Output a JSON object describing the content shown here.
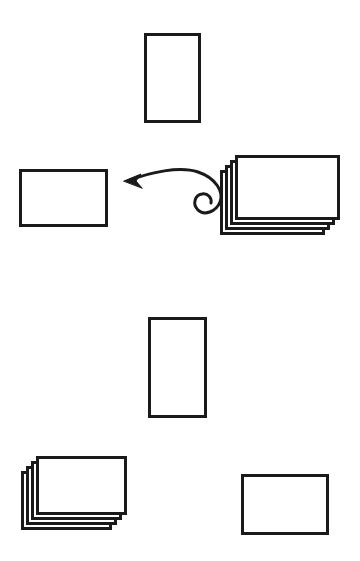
{
  "canvas": {
    "width": 360,
    "height": 561,
    "background_color": "#ffffff",
    "stroke_color": "#1a1a1a",
    "card_fill_color": "#ffffff",
    "description": "Hand-drawn style diagram of blank rectangular cards: single cards and stacks of four cards, with a curly spiral-tailed arrow pointing from the right-hand stack toward the left-hand single card."
  },
  "arrow": {
    "label": "curly-arrow-left",
    "stroke_color": "#1a1a1a",
    "stroke_width": 3,
    "direction": "left",
    "tail_style": "spiral",
    "tip": {
      "x": 124,
      "y": 181
    },
    "spiral_center": {
      "x": 205,
      "y": 206
    }
  },
  "groups": [
    {
      "name": "top-single-card",
      "type": "single",
      "orientation": "portrait",
      "count": 1,
      "x": 144,
      "y": 33,
      "width": 57,
      "height": 90,
      "border_width": 3
    },
    {
      "name": "middle-left-single-card",
      "type": "single",
      "orientation": "landscape",
      "count": 1,
      "x": 19,
      "y": 169,
      "width": 89,
      "height": 58,
      "border_width": 3
    },
    {
      "name": "middle-right-card-stack",
      "type": "stack",
      "orientation": "landscape",
      "count": 4,
      "x": 235,
      "y": 155,
      "width": 105,
      "height": 65,
      "offset_x": -5,
      "offset_y": 5,
      "border_width": 3
    },
    {
      "name": "lower-middle-single-card",
      "type": "single",
      "orientation": "portrait",
      "count": 1,
      "x": 148,
      "y": 317,
      "width": 59,
      "height": 101,
      "border_width": 3
    },
    {
      "name": "bottom-left-card-stack",
      "type": "stack",
      "orientation": "landscape",
      "count": 4,
      "x": 36,
      "y": 456,
      "width": 91,
      "height": 59,
      "offset_x": -5,
      "offset_y": 5,
      "border_width": 3
    },
    {
      "name": "bottom-right-single-card",
      "type": "single",
      "orientation": "landscape",
      "count": 1,
      "x": 241,
      "y": 474,
      "width": 88,
      "height": 61,
      "border_width": 3
    }
  ]
}
